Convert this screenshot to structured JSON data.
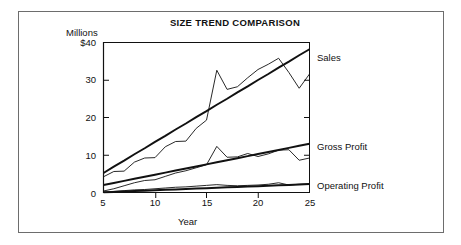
{
  "figure": {
    "title": "SIZE TREND COMPARISON",
    "y_unit_label": "Millions",
    "x_title": "Year"
  },
  "axes": {
    "y_ticks": [
      "$40",
      "30",
      "20",
      "10",
      "0"
    ],
    "x_ticks": [
      "5",
      "10",
      "15",
      "20",
      "25"
    ]
  },
  "series_labels": {
    "sales": "Sales",
    "gross_profit": "Gross Profit",
    "operating_profit": "Operating Profit"
  },
  "colors": {
    "line": "#111111",
    "frame": "#6d6d6d",
    "background": "#ffffff"
  },
  "chart_data": {
    "type": "line",
    "title": "SIZE TREND COMPARISON",
    "xlabel": "Year",
    "ylabel": "Millions",
    "xlim": [
      5,
      25
    ],
    "ylim": [
      0,
      40
    ],
    "grid": false,
    "legend_position": "right-of-plot-inline",
    "x_tick_values": [
      5,
      10,
      15,
      20,
      25
    ],
    "y_tick_values": [
      0,
      10,
      20,
      30,
      40
    ],
    "y_tick_labels": [
      "0",
      "10",
      "20",
      "30",
      "$40"
    ],
    "x": [
      5,
      6,
      7,
      8,
      9,
      10,
      11,
      12,
      13,
      14,
      15,
      16,
      17,
      18,
      19,
      20,
      21,
      22,
      23,
      24,
      25
    ],
    "series": [
      {
        "name": "Sales",
        "kind": "actual",
        "values": [
          4.2,
          5.6,
          5.7,
          8.1,
          9.2,
          9.3,
          12.2,
          13.6,
          13.7,
          17.1,
          19.3,
          32.6,
          27.5,
          28.2,
          30.6,
          32.8,
          34.2,
          35.8,
          32.0,
          27.8,
          31.6
        ]
      },
      {
        "name": "Sales Trend",
        "kind": "trend",
        "values": [
          5.2,
          6.9,
          8.5,
          10.2,
          11.8,
          13.5,
          15.1,
          16.8,
          18.4,
          20.1,
          21.7,
          23.4,
          25.0,
          26.7,
          28.3,
          30.0,
          31.6,
          33.3,
          34.9,
          36.6,
          38.2
        ]
      },
      {
        "name": "Gross Profit",
        "kind": "actual",
        "values": [
          0.4,
          1.0,
          1.8,
          2.6,
          3.2,
          3.4,
          4.3,
          5.2,
          5.8,
          6.6,
          7.4,
          12.3,
          9.4,
          9.5,
          10.4,
          9.6,
          10.3,
          11.3,
          11.4,
          8.6,
          9.2
        ]
      },
      {
        "name": "Gross Profit Trend",
        "kind": "trend",
        "values": [
          2.0,
          2.55,
          3.1,
          3.65,
          4.2,
          4.75,
          5.3,
          5.85,
          6.4,
          6.95,
          7.5,
          8.05,
          8.6,
          9.15,
          9.7,
          10.25,
          10.8,
          11.35,
          11.9,
          12.45,
          13.0
        ]
      },
      {
        "name": "Operating Profit",
        "kind": "actual",
        "values": [
          0.1,
          0.3,
          0.5,
          0.7,
          0.8,
          1.0,
          1.2,
          1.4,
          1.5,
          1.7,
          1.9,
          2.1,
          1.9,
          1.8,
          1.9,
          2.0,
          2.2,
          2.6,
          2.0,
          2.2,
          2.3
        ]
      },
      {
        "name": "Operating Profit Trend",
        "kind": "trend",
        "values": [
          0.05,
          0.16,
          0.27,
          0.38,
          0.49,
          0.6,
          0.71,
          0.82,
          0.93,
          1.04,
          1.15,
          1.26,
          1.37,
          1.48,
          1.59,
          1.7,
          1.81,
          1.92,
          2.03,
          2.14,
          2.25
        ]
      }
    ],
    "annotations": [
      {
        "text": "Sales",
        "anchor_x": 25,
        "anchor_y": 37
      },
      {
        "text": "Gross Profit",
        "anchor_x": 25,
        "anchor_y": 13
      },
      {
        "text": "Operating Profit",
        "anchor_x": 25,
        "anchor_y": 2.3
      }
    ]
  }
}
